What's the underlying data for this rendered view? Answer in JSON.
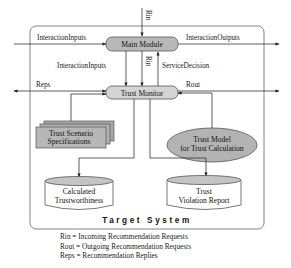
{
  "caption_partial": "... ... ... ng ... ... ... ypi ...",
  "system": {
    "title": "Target System"
  },
  "nodes": {
    "main_module": "Main Module",
    "trust_monitor": "Trust Monitor",
    "trust_scenario": [
      "Trust Scenario",
      "Specifications"
    ],
    "trust_model": [
      "Trust Model",
      "for Trust Calculation"
    ],
    "calculated_trust": [
      "Calculated",
      "Trustworthiness"
    ],
    "violation_report": [
      "Trust",
      "Violation Report"
    ]
  },
  "edges": {
    "rin_top": "Rin",
    "rin_mid": "Rin",
    "interaction_inputs_in": "InteractionInputs",
    "interaction_outputs": "InteractionOutputs",
    "interaction_inputs_mid": "InteractionInputs",
    "service_decision": "ServiceDecision",
    "reps": "Reps",
    "rout": "Rout"
  },
  "legend": [
    "Rin = Incoming Recommendation Requests",
    "Rout = Outgoing Recommendation Requests",
    "Reps = Recommendation Replies"
  ],
  "colors": {
    "node_fill": "#b9b9b9",
    "node_stroke": "#555555",
    "system_stroke": "#777777",
    "db_fill_top": "#c4c4c4"
  }
}
